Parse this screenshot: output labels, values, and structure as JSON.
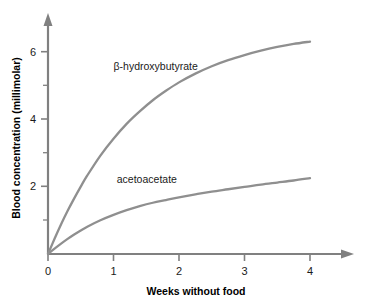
{
  "chart_data": {
    "type": "line",
    "title": "",
    "xlabel": "Weeks without food",
    "ylabel": "Blood concentration (millimolar)",
    "xlim": [
      0,
      4.55
    ],
    "ylim": [
      0,
      7.0
    ],
    "xticks": [
      0,
      1,
      2,
      3,
      4
    ],
    "xtick_labels": [
      "0",
      "1",
      "2",
      "3",
      "4"
    ],
    "yticks": [
      2,
      4,
      6
    ],
    "ytick_labels": [
      "2",
      "4",
      "6"
    ],
    "yticks_minor": [
      1,
      3,
      5
    ],
    "grid": false,
    "legend_position": "inline-annotation",
    "series": [
      {
        "name": "β-hydroxybutyrate",
        "label_text": "β-hydroxybutyrate",
        "color": "#8f8f8f",
        "x": [
          0,
          0.1,
          0.2,
          0.3,
          0.4,
          0.5,
          0.6,
          0.8,
          1.0,
          1.2,
          1.4,
          1.6,
          1.8,
          2.0,
          2.25,
          2.5,
          2.75,
          3.0,
          3.25,
          3.5,
          3.75,
          4.0
        ],
        "values": [
          0,
          0.45,
          0.88,
          1.28,
          1.65,
          2.0,
          2.33,
          2.92,
          3.42,
          3.86,
          4.23,
          4.56,
          4.84,
          5.09,
          5.35,
          5.57,
          5.75,
          5.9,
          6.03,
          6.14,
          6.23,
          6.3
        ]
      },
      {
        "name": "acetoacetate",
        "label_text": "acetoacetate",
        "color": "#8f8f8f",
        "x": [
          0,
          0.1,
          0.2,
          0.3,
          0.4,
          0.5,
          0.6,
          0.8,
          1.0,
          1.2,
          1.4,
          1.6,
          1.8,
          2.0,
          2.25,
          2.5,
          2.75,
          3.0,
          3.25,
          3.5,
          3.75,
          4.0
        ],
        "values": [
          0,
          0.16,
          0.31,
          0.45,
          0.58,
          0.7,
          0.81,
          1.0,
          1.16,
          1.3,
          1.42,
          1.52,
          1.6,
          1.68,
          1.77,
          1.85,
          1.92,
          1.99,
          2.06,
          2.12,
          2.18,
          2.25
        ]
      }
    ],
    "annotations": [
      {
        "text": "β-hydroxybutyrate",
        "x": 1.0,
        "y": 5.45
      },
      {
        "text": "acetoacetate",
        "x": 1.05,
        "y": 2.12
      }
    ]
  }
}
